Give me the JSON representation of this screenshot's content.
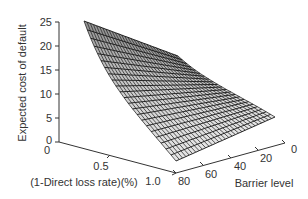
{
  "chart_data": {
    "type": "surface",
    "title": "",
    "zlabel": "Expected cost of default",
    "xlabel": "(1-Direct loss rate)(%)",
    "ylabel": "Barrier level",
    "z_ticks": [
      "0",
      "5",
      "10",
      "15",
      "20",
      "25"
    ],
    "x_ticks": [
      "0",
      "0.5",
      "1.0"
    ],
    "y_ticks": [
      "0",
      "20",
      "40",
      "60",
      "80"
    ],
    "zlim": [
      0,
      25
    ],
    "xlim": [
      0,
      1.0
    ],
    "ylim": [
      0,
      80
    ],
    "grid": false,
    "style": "wireframe mesh, black lines on light gray faces",
    "corners": [
      {
        "x": 0,
        "y": 80,
        "z": 24,
        "desc": "peak at (1-direct loss)=0, barrier=80"
      },
      {
        "x": 0,
        "y": 0,
        "z": 16.5,
        "desc": "back-right corner"
      },
      {
        "x": 1.0,
        "y": 0,
        "z": 5,
        "desc": "right tip"
      },
      {
        "x": 1.0,
        "y": 80,
        "z": 0,
        "desc": "front corner, near zero"
      }
    ]
  },
  "axes": {
    "z_label": "Expected cost of default",
    "x_label": "(1-Direct loss rate)(%)",
    "y_label": "Barrier level",
    "z_ticks": [
      "0",
      "5",
      "10",
      "15",
      "20",
      "25"
    ],
    "x_ticks": [
      "0",
      "0.5",
      "1.0"
    ],
    "y_ticks": [
      "0",
      "20",
      "40",
      "60",
      "80"
    ]
  }
}
